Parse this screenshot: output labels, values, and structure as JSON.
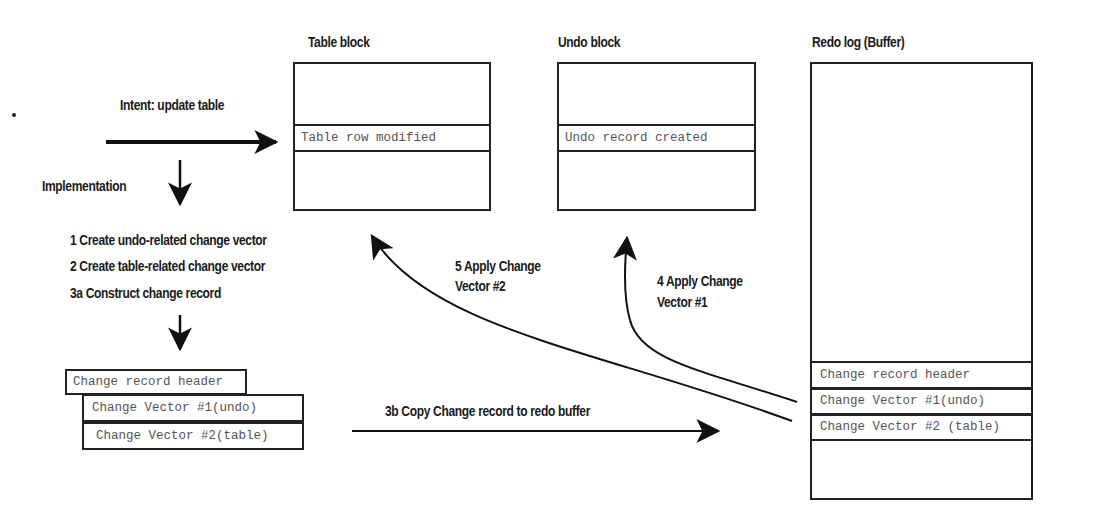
{
  "intent_label": "Intent: update table",
  "implementation_label": "Implementation",
  "steps": [
    "1 Create undo-related change vector",
    "2 Create table-related change vector",
    "3a Construct change record"
  ],
  "change_record": {
    "header": "Change record header",
    "vector1": "Change Vector #1(undo)",
    "vector2": "Change Vector #2(table)"
  },
  "table_block": {
    "title": "Table block",
    "row": "Table row modified"
  },
  "undo_block": {
    "title": "Undo block",
    "row": "Undo record created"
  },
  "redo_log": {
    "title": "Redo log (Buffer)",
    "rows": [
      "Change record header",
      "Change Vector #1(undo)",
      "Change Vector #2 (table)"
    ]
  },
  "arrow_labels": {
    "copy": "3b Copy Change record to redo buffer",
    "apply2_line1": "5 Apply Change",
    "apply2_line2": "Vector #2",
    "apply1_line1": "4 Apply Change",
    "apply1_line2": "Vector #1"
  }
}
